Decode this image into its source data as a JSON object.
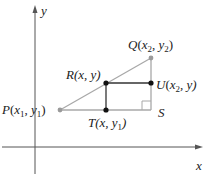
{
  "diagram": {
    "type": "coordinate-geometry",
    "colors": {
      "axis": "#555555",
      "segment_gray": "#a8a8a8",
      "segment_dark": "#333333",
      "point_dark": "#111111",
      "point_gray": "#9a9a9a",
      "text": "#222222"
    },
    "axes": {
      "x_label": "x",
      "y_label": "y"
    },
    "points": {
      "P": {
        "name": "P",
        "coords_text": "(x1, y1)",
        "letter": "P",
        "open": "(",
        "v1": "x",
        "s1": "1",
        "comma": ", ",
        "v2": "y",
        "s2": "1",
        "close": ")"
      },
      "Q": {
        "name": "Q",
        "coords_text": "(x2, y2)",
        "letter": "Q",
        "open": "(",
        "v1": "x",
        "s1": "2",
        "comma": ", ",
        "v2": "y",
        "s2": "2",
        "close": ")"
      },
      "R": {
        "name": "R",
        "coords_text": "(x, y)",
        "letter": "R",
        "text": "(x, y)"
      },
      "U": {
        "name": "U",
        "coords_text": "(x2, y)",
        "letter": "U",
        "open": "(",
        "v1": "x",
        "s1": "2",
        "rest": ", y)"
      },
      "T": {
        "name": "T",
        "coords_text": "(x, y1)",
        "letter": "T",
        "pre": "(x, y",
        "s1": "1",
        "close": ")"
      },
      "S": {
        "name": "S",
        "letter": "S"
      }
    }
  }
}
